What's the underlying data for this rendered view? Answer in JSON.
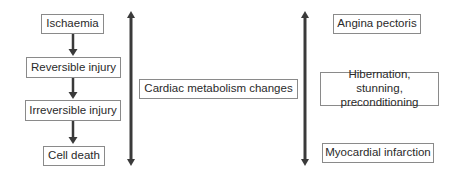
{
  "diagram": {
    "left_column": {
      "nodes": [
        {
          "id": "ischaemia",
          "label": "Ischaemia"
        },
        {
          "id": "reversible",
          "label": "Reversible injury"
        },
        {
          "id": "irreversible",
          "label": "Irreversible injury"
        },
        {
          "id": "cell_death",
          "label": "Cell death"
        }
      ],
      "edges": [
        {
          "from": "ischaemia",
          "to": "reversible"
        },
        {
          "from": "reversible",
          "to": "irreversible"
        },
        {
          "from": "irreversible",
          "to": "cell_death"
        }
      ]
    },
    "center": {
      "label": "Cardiac metabolism changes"
    },
    "right_column": {
      "nodes": [
        {
          "id": "angina",
          "label": "Angina pectoris"
        },
        {
          "id": "hibernation",
          "label": "Hibernation, stunning, preconditioning"
        },
        {
          "id": "mi",
          "label": "Myocardial infarction"
        }
      ]
    },
    "double_arrows": [
      {
        "id": "left-double-arrow",
        "direction": "bidirectional"
      },
      {
        "id": "right-double-arrow",
        "direction": "bidirectional"
      }
    ],
    "colors": {
      "arrow": "#3a3a3a",
      "box_border": "#8a8a8a",
      "text": "#2a2a2a",
      "background": "#ffffff"
    }
  }
}
